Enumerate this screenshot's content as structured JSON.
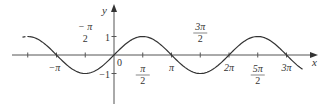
{
  "axes": {
    "x_label": "x",
    "y_label": "y",
    "origin_label": "0"
  },
  "x_ticks": [
    {
      "value": -4.71239,
      "label_num": "",
      "label_den": ""
    },
    {
      "value": -3.14159,
      "label_num": "−π",
      "label_den": ""
    },
    {
      "value": -1.5708,
      "label_num": "− π",
      "label_den": "2"
    },
    {
      "value": 1.5708,
      "label_num": "π",
      "label_den": "2"
    },
    {
      "value": 3.14159,
      "label_num": "π",
      "label_den": ""
    },
    {
      "value": 4.71239,
      "label_num": "3π",
      "label_den": "2"
    },
    {
      "value": 6.28319,
      "label_num": "2π",
      "label_den": ""
    },
    {
      "value": 7.85398,
      "label_num": "5π",
      "label_den": "2"
    },
    {
      "value": 9.42478,
      "label_num": "3π",
      "label_den": ""
    }
  ],
  "y_ticks": [
    {
      "value": 1,
      "label": "1"
    },
    {
      "value": -1,
      "label": "−1"
    }
  ],
  "curve": {
    "function": "sin(x)",
    "x_range": [
      -5.0,
      10.3
    ],
    "dashed_start_until": -4.6,
    "color": "#333333"
  },
  "colors": {
    "axis": "#555555",
    "curve": "#333333",
    "text": "#333333"
  }
}
